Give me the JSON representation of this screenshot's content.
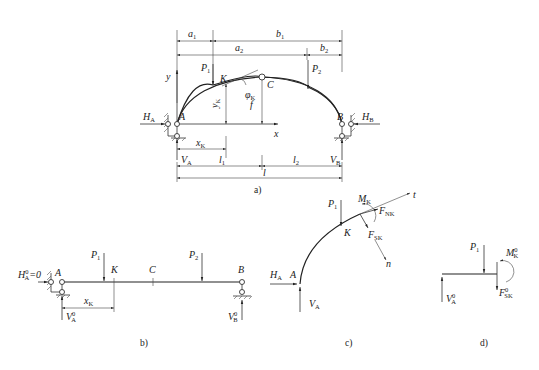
{
  "figures": {
    "a": {
      "caption": "a)",
      "dimensions": {
        "a1": "a",
        "a1_sub": "1",
        "b1": "b",
        "b1_sub": "1",
        "a2": "a",
        "a2_sub": "2",
        "b2": "b",
        "b2_sub": "2"
      },
      "loads": {
        "P1": "P",
        "P1_sub": "1",
        "P2": "P",
        "P2_sub": "2"
      },
      "points": {
        "A": "A",
        "B": "B",
        "C": "C",
        "K": "K"
      },
      "axes": {
        "y": "y",
        "x": "x"
      },
      "labels": {
        "phiK": "φ",
        "phiK_sub": "K",
        "yK": "y",
        "yK_sub": "K",
        "f": "f",
        "xK": "x",
        "xK_sub": "K"
      },
      "reactions": {
        "HA": "H",
        "HA_sub": "A",
        "HB": "H",
        "HB_sub": "B",
        "VA": "V",
        "VA_sub": "A",
        "VB": "V",
        "VB_sub": "B"
      },
      "spans": {
        "l1": "l",
        "l1_sub": "1",
        "l2": "l",
        "l2_sub": "2",
        "l": "l"
      }
    },
    "b": {
      "caption": "b)",
      "loads": {
        "P1": "P",
        "P1_sub": "1",
        "P2": "P",
        "P2_sub": "2"
      },
      "points": {
        "A": "A",
        "B": "B",
        "C": "C",
        "K": "K"
      },
      "reactions": {
        "HA0": "H",
        "HA0_sup": "0",
        "HA0_sub": "A",
        "HA0_eq": "=0",
        "VA0": "V",
        "VA0_sup": "0",
        "VA0_sub": "A",
        "VB0": "V",
        "VB0_sup": "0",
        "VB0_sub": "B"
      },
      "labels": {
        "xK": "x",
        "xK_sub": "K"
      }
    },
    "c": {
      "caption": "c)",
      "loads": {
        "P1": "P",
        "P1_sub": "1"
      },
      "points": {
        "A": "A",
        "K": "K"
      },
      "forces": {
        "MK": "M",
        "MK_sub": "K",
        "FNK": "F",
        "FNK_sub": "NK",
        "FSK": "F",
        "FSK_sub": "SK",
        "t": "t",
        "n": "n",
        "HA": "H",
        "HA_sub": "A",
        "VA": "V",
        "VA_sub": "A"
      }
    },
    "d": {
      "caption": "d)",
      "loads": {
        "P1": "P",
        "P1_sub": "1"
      },
      "forces": {
        "MK0": "M",
        "MK0_sup": "0",
        "MK0_sub": "K",
        "FSK0": "F",
        "FSK0_sup": "0",
        "FSK0_sub": "SK",
        "VA0": "V",
        "VA0_sup": "0",
        "VA0_sub": "A"
      }
    }
  }
}
